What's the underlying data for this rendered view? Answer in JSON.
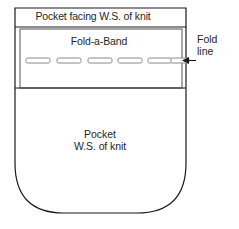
{
  "diagram": {
    "colors": {
      "outline": "#1a1a1a",
      "band_outline": "#7a7a7a",
      "dash_outline": "#8a8a8a",
      "background": "#ffffff",
      "text": "#262626"
    },
    "facing": {
      "label": "Pocket facing W.S. of knit"
    },
    "band": {
      "label": "Fold-a-Band",
      "dash_count": 6,
      "dashes": [
        {
          "index": 1
        },
        {
          "index": 2
        },
        {
          "index": 3
        },
        {
          "index": 4
        },
        {
          "index": 5
        },
        {
          "index": 6
        }
      ]
    },
    "pocket": {
      "label_line1": "Pocket",
      "label_line2": "W.S. of knit"
    },
    "fold_line": {
      "label_line1": "Fold",
      "label_line2": "line",
      "marker": "left-arrow"
    }
  }
}
